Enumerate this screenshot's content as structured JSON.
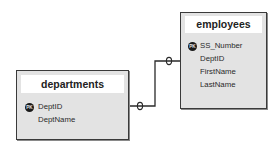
{
  "tables": {
    "employees": {
      "title": "employees",
      "fields": [
        {
          "name": "SS_Number",
          "pk": true
        },
        {
          "name": "DeptID",
          "pk": false
        },
        {
          "name": "FirstName",
          "pk": false
        },
        {
          "name": "LastName",
          "pk": false
        }
      ]
    },
    "departments": {
      "title": "departments",
      "fields": [
        {
          "name": "DeptID",
          "pk": true
        },
        {
          "name": "DeptName",
          "pk": false
        }
      ]
    }
  },
  "pk_label": "PK",
  "relationship": {
    "from": "departments.DeptID",
    "to": "employees.DeptID",
    "from_cardinality": "0",
    "to_cardinality": "0"
  },
  "colors": {
    "box_fill": "#e3e3e3",
    "box_border": "#3a3a3a",
    "header_fill": "#ffffff",
    "line": "#2a2a2a"
  }
}
